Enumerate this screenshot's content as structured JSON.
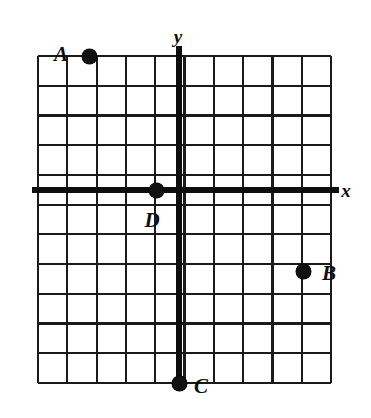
{
  "figure": {
    "type": "coordinate-grid",
    "background_color": "#ffffff",
    "ink_color": "#111111"
  },
  "grid": {
    "left_px": 38,
    "right_px": 331,
    "top_px": 56,
    "bottom_px": 383,
    "columns": 10,
    "rows": 11,
    "cell_width_px": 29.3,
    "cell_height_px": 29.7,
    "line_color": "#1a1a1a",
    "line_width_px": 2.2
  },
  "axes": {
    "x_axis": {
      "label": "x",
      "label_x_px": 346,
      "label_y_px": 190,
      "y_px": 190,
      "line_width_px": 5.5,
      "color": "#0d0d0d"
    },
    "y_axis": {
      "label": "y",
      "label_x_px": 178,
      "label_y_px": 36,
      "x_px": 179,
      "line_width_px": 5.5,
      "color": "#0d0d0d"
    }
  },
  "points": [
    {
      "name": "A",
      "label": "A",
      "dot_x_px": 89,
      "dot_y_px": 56,
      "label_x_px": 61,
      "label_y_px": 54,
      "grid_x": -3,
      "grid_y": 4.5
    },
    {
      "name": "B",
      "label": "B",
      "dot_x_px": 303,
      "dot_y_px": 271,
      "label_x_px": 329,
      "label_y_px": 273,
      "grid_x": 4.2,
      "grid_y": -2.7
    },
    {
      "name": "C",
      "label": "C",
      "dot_x_px": 179,
      "dot_y_px": 383,
      "label_x_px": 201,
      "label_y_px": 386,
      "grid_x": 0,
      "grid_y": -6.5
    },
    {
      "name": "D",
      "label": "D",
      "dot_x_px": 156,
      "dot_y_px": 190,
      "label_x_px": 152,
      "label_y_px": 220,
      "grid_x": -0.8,
      "grid_y": 0
    }
  ]
}
